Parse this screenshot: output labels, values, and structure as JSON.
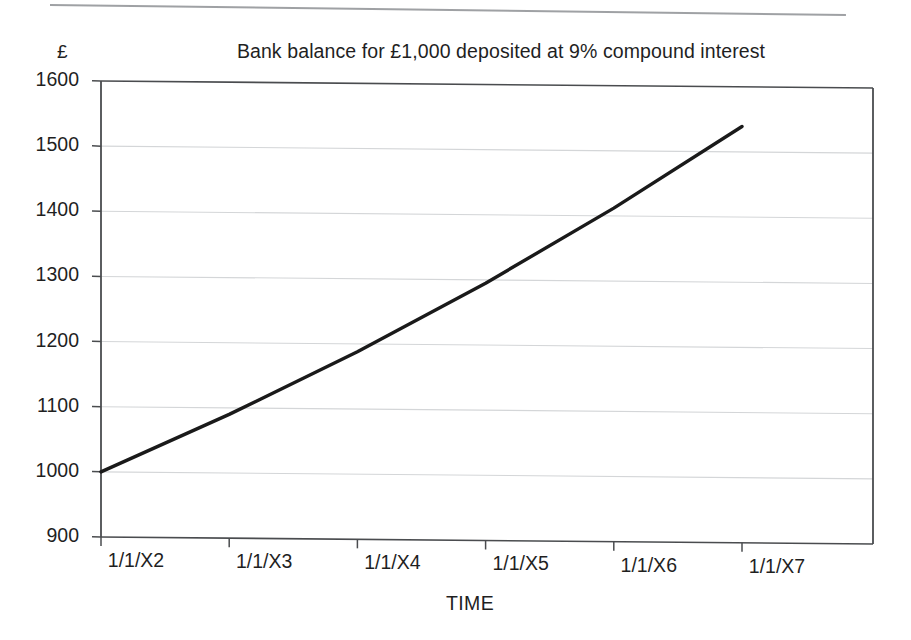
{
  "figure": {
    "title": "Bank balance for £1,000 deposited at 9% compound interest",
    "currency_unit": "£",
    "x_axis_label": "TIME",
    "colors": {
      "series_line": "#1a1a1a",
      "gridline": "#d4d6d8",
      "axis": "#4a4c4f",
      "background": "#ffffff",
      "text": "#1f1f1f",
      "top_rule": "#8e9094"
    }
  },
  "chart_data": {
    "type": "line",
    "title": "Bank balance for £1,000 deposited at 9% compound interest",
    "xlabel": "TIME",
    "ylabel": "£",
    "categories": [
      "1/1/X2",
      "1/1/X3",
      "1/1/X4",
      "1/1/X5",
      "1/1/X6",
      "1/1/X7"
    ],
    "values": [
      1000,
      1090,
      1188,
      1295,
      1412,
      1539
    ],
    "series": [
      {
        "name": "Bank balance",
        "values": [
          1000,
          1090,
          1188,
          1295,
          1412,
          1539
        ]
      }
    ],
    "ylim": [
      900,
      1600
    ],
    "ytick_labels": [
      "1600",
      "1500",
      "1400",
      "1300",
      "1200",
      "1100",
      "1000",
      "900"
    ],
    "ytick_values": [
      1600,
      1500,
      1400,
      1300,
      1200,
      1100,
      1000,
      900
    ],
    "xtick_labels": [
      "1/1/X2",
      "1/1/X3",
      "1/1/X4",
      "1/1/X5",
      "1/1/X6",
      "1/1/X7"
    ],
    "grid": true,
    "grid_axis": "y",
    "legend": false,
    "legend_position": "none",
    "annotations": []
  }
}
